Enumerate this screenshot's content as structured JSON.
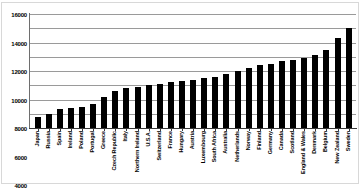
{
  "chart_data": {
    "type": "bar",
    "title": "",
    "subtitle": "",
    "xlabel": "",
    "ylabel": "",
    "ylim": [
      0,
      16000
    ],
    "yticks": [
      0,
      2000,
      4000,
      6000,
      8000,
      10000,
      12000,
      14000,
      16000
    ],
    "ytick_labels": [
      "0",
      "2000",
      "4000",
      "6000",
      "8000",
      "10000",
      "12000",
      "14000",
      "16000"
    ],
    "grid": true,
    "legend": null,
    "bar_color": "#000000",
    "categories": [
      "Japan",
      "Russia",
      "Spain",
      "Ireland",
      "Poland",
      "Portugal",
      "Greece",
      "Czech Republic",
      "Italy",
      "Northern Ireland",
      "U.S.A.",
      "Switzerland",
      "France",
      "Hungary",
      "Austria",
      "Luxembourg",
      "South Africa",
      "Australia",
      "Netherlands",
      "Norway",
      "Finland",
      "Germany",
      "Canada",
      "Scotland",
      "England & Wales",
      "Denmark",
      "Belgium",
      "New Zealand",
      "Sweden"
    ],
    "values": [
      1600,
      2000,
      2600,
      2800,
      3000,
      3400,
      4400,
      5200,
      5600,
      5800,
      6000,
      6200,
      6400,
      6600,
      6800,
      7000,
      7200,
      7600,
      8000,
      8400,
      8800,
      9000,
      9400,
      9600,
      9800,
      10200,
      11000,
      12600,
      14000
    ]
  }
}
